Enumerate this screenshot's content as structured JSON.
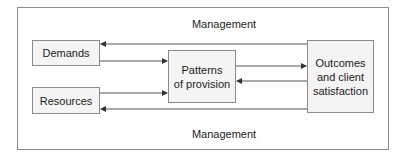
{
  "diagram": {
    "top_label": "Management",
    "bottom_label": "Management",
    "nodes": {
      "demands": "Demands",
      "resources": "Resources",
      "patterns_line1": "Patterns",
      "patterns_line2": "of provision",
      "outcomes_line1": "Outcomes",
      "outcomes_line2": "and client",
      "outcomes_line3": "satisfaction"
    },
    "edges": [
      {
        "from": "Outcomes and client satisfaction",
        "to": "Demands",
        "label": "Management"
      },
      {
        "from": "Demands",
        "to": "Patterns of provision"
      },
      {
        "from": "Resources",
        "to": "Patterns of provision"
      },
      {
        "from": "Patterns of provision",
        "to": "Outcomes and client satisfaction"
      },
      {
        "from": "Outcomes and client satisfaction",
        "to": "Patterns of provision"
      },
      {
        "from": "Outcomes and client satisfaction",
        "to": "Resources",
        "label": "Management"
      }
    ],
    "colors": {
      "line": "#333333",
      "box_border": "#8a8a8a",
      "box_fill": "#f4f4f4"
    }
  }
}
